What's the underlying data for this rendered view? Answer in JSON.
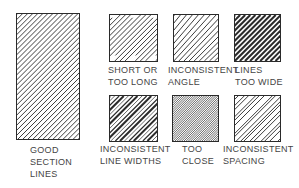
{
  "figure": {
    "items": [
      {
        "id": "good",
        "label_lines": [
          "GOOD",
          "SECTION",
          "LINES"
        ],
        "box": {
          "x": 16,
          "y": 13,
          "w": 64,
          "h": 127
        },
        "label_pos": {
          "x": 30,
          "y": 144
        },
        "hatch": {
          "spacing": 5,
          "stroke": 0.9,
          "angle": 45,
          "variant": "good"
        }
      },
      {
        "id": "short-long",
        "label_lines": [
          "SHORT OR",
          "TOO LONG"
        ],
        "box": {
          "x": 109,
          "y": 14,
          "w": 49,
          "h": 48
        },
        "label_pos": {
          "x": 109,
          "y": 64
        },
        "hatch": {
          "spacing": 5,
          "stroke": 0.9,
          "angle": 45,
          "variant": "short-long"
        }
      },
      {
        "id": "inconsistent-angle",
        "label_lines": [
          "INCONSISTENT",
          "ANGLE"
        ],
        "box": {
          "x": 173,
          "y": 14,
          "w": 46,
          "h": 48
        },
        "label_pos": {
          "x": 172,
          "y": 64
        },
        "hatch": {
          "spacing": 5,
          "stroke": 0.9,
          "angle": 45,
          "variant": "angle"
        }
      },
      {
        "id": "too-wide",
        "label_lines": [
          "LINES",
          "TOO WIDE"
        ],
        "box": {
          "x": 234,
          "y": 14,
          "w": 47,
          "h": 48
        },
        "label_pos": {
          "x": 234,
          "y": 64
        },
        "hatch": {
          "spacing": 5,
          "stroke": 2.0,
          "angle": 45,
          "variant": "wide"
        }
      },
      {
        "id": "line-widths",
        "label_lines": [
          "INCONSISTENT",
          "LINE WIDTHS"
        ],
        "box": {
          "x": 109,
          "y": 95,
          "w": 49,
          "h": 47
        },
        "label_pos": {
          "x": 104,
          "y": 143
        },
        "hatch": {
          "spacing": 4.5,
          "stroke": 0.9,
          "angle": 45,
          "variant": "widths"
        }
      },
      {
        "id": "too-close",
        "label_lines": [
          "TOO",
          "CLOSE"
        ],
        "box": {
          "x": 172,
          "y": 95,
          "w": 47,
          "h": 47
        },
        "label_pos": {
          "x": 182,
          "y": 143
        },
        "hatch": {
          "spacing": 2.2,
          "stroke": 0.7,
          "angle": 45,
          "variant": "close"
        }
      },
      {
        "id": "spacing",
        "label_lines": [
          "INCONSISTENT",
          "SPACING"
        ],
        "box": {
          "x": 234,
          "y": 95,
          "w": 47,
          "h": 47
        },
        "label_pos": {
          "x": 224,
          "y": 143
        },
        "hatch": {
          "spacing": 5,
          "stroke": 0.9,
          "angle": 45,
          "variant": "spacing"
        }
      }
    ]
  },
  "labels": {
    "good": "GOOD\nSECTION\nLINES",
    "short_long": "SHORT OR\nTOO LONG",
    "inconsistent_angle": "INCONSISTENT\nANGLE",
    "too_wide": "LINES\nTOO WIDE",
    "line_widths": "INCONSISTENT\nLINE WIDTHS",
    "too_close": "TOO\nCLOSE",
    "spacing": "INCONSISTENT\nSPACING"
  },
  "colors": {
    "line": "#2a2a2a",
    "text": "#444444",
    "background": "#ffffff"
  }
}
